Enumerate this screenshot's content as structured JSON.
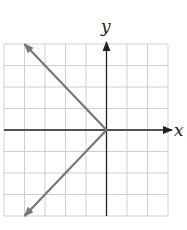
{
  "chart_data": {
    "type": "line",
    "title": "",
    "xlabel": "x",
    "ylabel": "y",
    "xlim": [
      -5,
      3
    ],
    "ylim": [
      -4,
      4
    ],
    "grid": true,
    "grid_step": 1,
    "series": [
      {
        "name": "upper-ray",
        "x": [
          0,
          -4
        ],
        "y": [
          0,
          4
        ],
        "arrow_end": true
      },
      {
        "name": "lower-ray",
        "x": [
          0,
          -4
        ],
        "y": [
          0,
          -4
        ],
        "arrow_end": true
      }
    ],
    "equation_hint": "x = -|y|",
    "colors": {
      "grid": "#cfcfcf",
      "axis": "#222222",
      "graph": "#777777"
    }
  },
  "axes": {
    "x_label": "x",
    "y_label": "y"
  }
}
